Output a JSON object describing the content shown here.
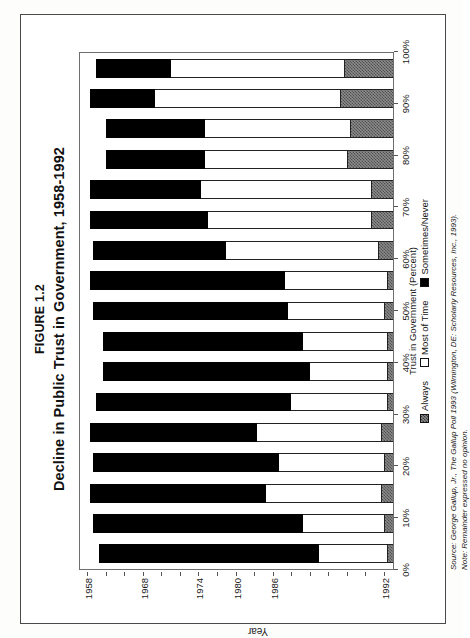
{
  "figure": {
    "number": "FIGURE 1.2",
    "title": "Decline in Public Trust in Government, 1958-1992"
  },
  "axes": {
    "x_title": "Trust in Government (Percent)",
    "y_title": "Year",
    "x_ticks": [
      "0%",
      "10%",
      "20%",
      "30%",
      "40%",
      "50%",
      "60%",
      "70%",
      "80%",
      "90%",
      "100%"
    ]
  },
  "legend": {
    "always": "Always",
    "most": "Most of Time",
    "never": "Sometimes/Never"
  },
  "notes": {
    "source": "Source: George Gallup, Jr., The Gallup Poll 1993 (Wilmington, DE: Scholarly Resources, Inc., 1993).",
    "note": "Note: Remainder expressed no opinion."
  },
  "chart_data": {
    "type": "bar",
    "orientation": "horizontal-stacked",
    "title": "Decline in Public Trust in Government, 1958-1992",
    "xlabel": "Trust in Government (Percent)",
    "ylabel": "Year",
    "xlim": [
      0,
      100
    ],
    "grid": false,
    "legend_position": "bottom",
    "stacked": true,
    "categories": [
      "1992",
      "1991",
      "1990",
      "1989",
      "1988",
      "1987",
      "1986",
      "1984",
      "1980",
      "1976",
      "1974",
      "1972",
      "1970",
      "1968",
      "1966",
      "1964",
      "1958"
    ],
    "visible_tick_labels": [
      "1992",
      "1986",
      "1980",
      "1974",
      "1968",
      "1958"
    ],
    "series": [
      {
        "name": "Always",
        "color": "#808080",
        "values": [
          2,
          3,
          4,
          3,
          4,
          2,
          2,
          2,
          3,
          2,
          5,
          7,
          7,
          15,
          14,
          17,
          16
        ]
      },
      {
        "name": "Most of Time",
        "color": "#ffffff",
        "values": [
          22,
          26,
          37,
          34,
          40,
          31,
          25,
          27,
          31,
          33,
          49,
          53,
          55,
          46,
          47,
          60,
          56
        ]
      },
      {
        "name": "Sometimes/Never",
        "color": "#000000",
        "values": [
          71,
          68,
          57,
          60,
          54,
          63,
          67,
          65,
          63,
          63,
          43,
          38,
          36,
          32,
          32,
          21,
          24
        ]
      }
    ]
  }
}
